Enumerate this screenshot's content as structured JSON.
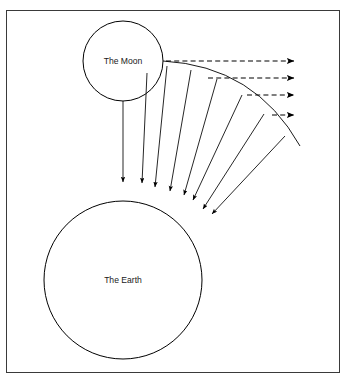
{
  "figure": {
    "type": "physics-diagram",
    "title_text": "",
    "background_color": "#ffffff",
    "stroke_color": "#000000",
    "frame_color": "#3a3a3a",
    "width": 347,
    "height": 380
  },
  "frame": {
    "name": "diagram-border",
    "x": 6,
    "y": 10,
    "width": 334,
    "height": 363
  },
  "bodies": [
    {
      "id": "moon",
      "label": "The Moon",
      "cx": 123,
      "cy": 61,
      "r": 40,
      "label_dx": 0,
      "label_dy": 1
    },
    {
      "id": "earth",
      "label": "The Earth",
      "cx": 123,
      "cy": 280,
      "r": 79,
      "label_dx": 0,
      "label_dy": 1
    }
  ],
  "trajectory_arc": {
    "name": "projectile-path",
    "start": [
      163,
      61
    ],
    "control": [
      255,
      66
    ],
    "end": [
      300,
      146
    ]
  },
  "fall_vectors": [
    {
      "id": "fall-1",
      "from": [
        123,
        101
      ],
      "to": [
        123,
        182
      ]
    },
    {
      "id": "fall-2",
      "from": [
        147,
        73
      ],
      "to": [
        142,
        183
      ]
    },
    {
      "id": "fall-3",
      "from": [
        167,
        66
      ],
      "to": [
        155,
        187
      ]
    },
    {
      "id": "fall-4",
      "from": [
        191,
        70
      ],
      "to": [
        170,
        191
      ]
    },
    {
      "id": "fall-5",
      "from": [
        217,
        79
      ],
      "to": [
        184,
        195
      ]
    },
    {
      "id": "fall-6",
      "from": [
        242,
        95
      ],
      "to": [
        193,
        200
      ]
    },
    {
      "id": "fall-7",
      "from": [
        264,
        114
      ],
      "to": [
        203,
        209
      ]
    },
    {
      "id": "fall-8",
      "from": [
        285,
        136
      ],
      "to": [
        212,
        214
      ]
    }
  ],
  "horizontal_vectors": [
    {
      "id": "velocity-1",
      "from": [
        166,
        61
      ],
      "to": [
        294,
        61
      ]
    },
    {
      "id": "velocity-2",
      "from": [
        208,
        78
      ],
      "to": [
        294,
        78
      ]
    },
    {
      "id": "velocity-3",
      "from": [
        247,
        95
      ],
      "to": [
        294,
        95
      ]
    },
    {
      "id": "velocity-4",
      "from": [
        272,
        115
      ],
      "to": [
        294,
        115
      ]
    }
  ],
  "arrowheads": {
    "fall_marker_name": "fall-arrowhead",
    "velocity_marker_name": "velocity-arrowhead"
  }
}
